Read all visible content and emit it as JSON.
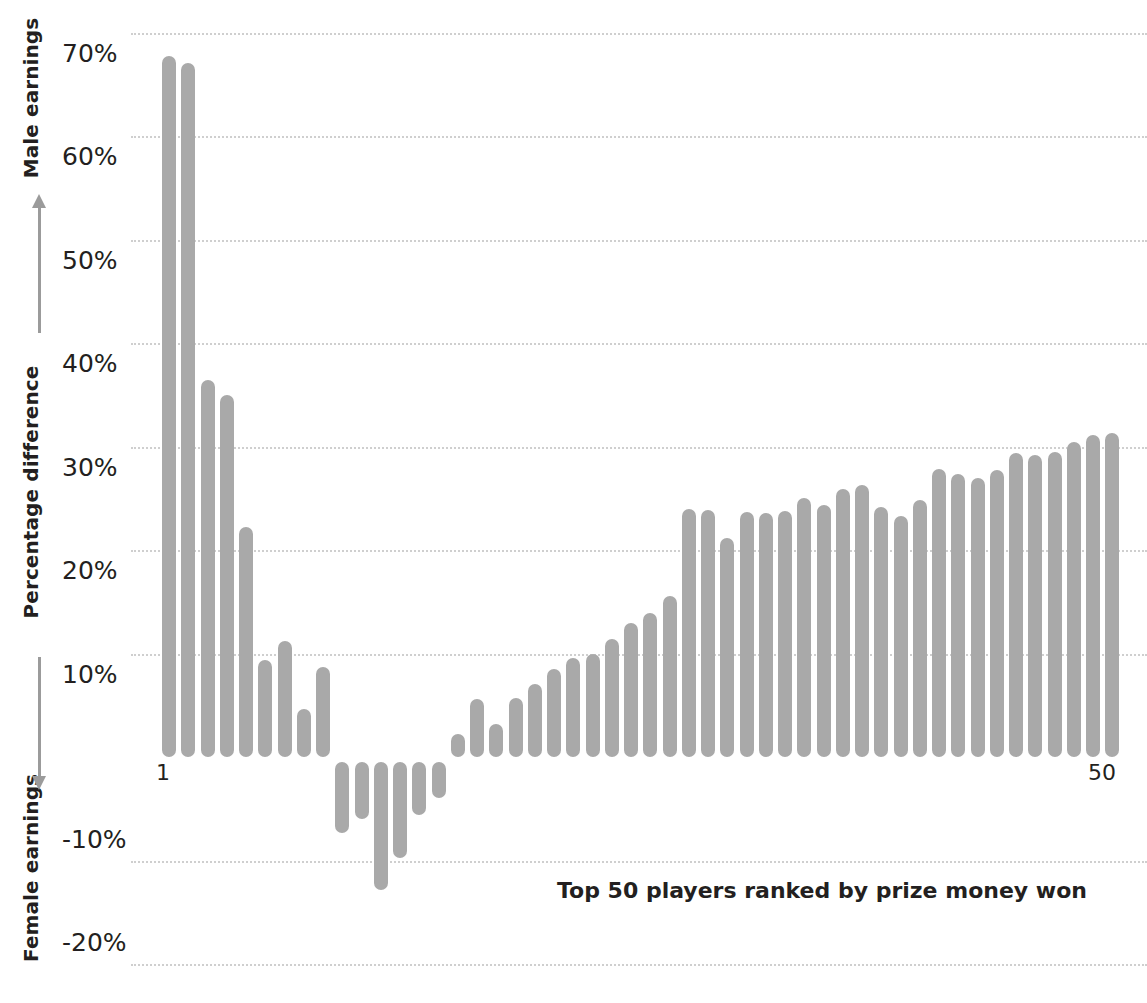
{
  "axis": {
    "top_caption": "Male earnings",
    "middle_caption": "Percentage difference",
    "bottom_caption": "Female earnings",
    "up_arrow_icon": "arrow-up-icon",
    "down_arrow_icon": "arrow-down-icon"
  },
  "caption": "Top 50 players ranked by prize money won",
  "x_first_label": "1",
  "x_last_label": "50",
  "colors": {
    "bar": "#a9a9a9",
    "gridline": "#cfcfcf",
    "text": "#231f20",
    "arrow": "#9b9b9b"
  },
  "chart_data": {
    "type": "bar",
    "title": "",
    "subtitle": "",
    "xlabel": "Top 50 players ranked by prize money won",
    "ylabel": "Percentage difference",
    "ylabel_positive_direction": "Male earnings",
    "ylabel_negative_direction": "Female earnings",
    "ylim": [
      -20,
      70
    ],
    "ytick_labels": [
      "70%",
      "60%",
      "50%",
      "40%",
      "30%",
      "20%",
      "10%",
      "-10%",
      "-20%"
    ],
    "ytick_values": [
      70,
      60,
      50,
      40,
      30,
      20,
      10,
      -10,
      -20
    ],
    "grid": true,
    "legend": "none",
    "xtick_labels": [
      "1",
      "50"
    ],
    "xtick_values": [
      1,
      50
    ],
    "categories": [
      1,
      2,
      3,
      4,
      5,
      6,
      7,
      8,
      9,
      10,
      11,
      12,
      13,
      14,
      15,
      16,
      17,
      18,
      19,
      20,
      21,
      22,
      23,
      24,
      25,
      26,
      27,
      28,
      29,
      30,
      31,
      32,
      33,
      34,
      35,
      36,
      37,
      38,
      39,
      40,
      41,
      42,
      43,
      44,
      45,
      46,
      47,
      48,
      49,
      50
    ],
    "values": [
      67.7,
      67.1,
      36.4,
      35.0,
      22.2,
      9.4,
      11.2,
      4.6,
      8.7,
      -6.9,
      -5.5,
      -12.4,
      -9.3,
      -5.1,
      -3.5,
      2.2,
      5.6,
      3.2,
      5.7,
      7.1,
      8.5,
      9.6,
      10.0,
      11.4,
      12.9,
      13.9,
      15.6,
      24.0,
      23.9,
      21.2,
      23.7,
      23.6,
      23.8,
      25.0,
      24.3,
      25.9,
      26.3,
      24.2,
      23.3,
      24.8,
      27.8,
      27.3,
      27.0,
      27.7,
      29.4,
      29.2,
      29.5,
      30.4,
      31.1,
      31.3
    ],
    "unit": "%"
  }
}
